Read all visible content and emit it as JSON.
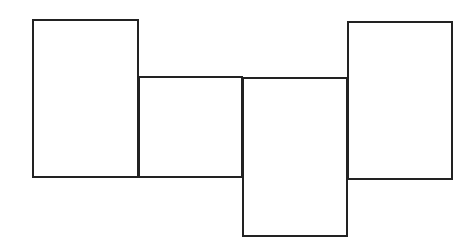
{
  "canvas": {
    "width": 474,
    "height": 246,
    "background": "#ffffff"
  },
  "style": {
    "stroke_color": "#222222",
    "stroke_width": 2
  },
  "shapes": [
    {
      "id": "rect-1",
      "label": "",
      "x": 32,
      "y": 19,
      "width": 107,
      "height": 159
    },
    {
      "id": "rect-2",
      "label": "",
      "x": 138,
      "y": 76,
      "width": 105,
      "height": 102
    },
    {
      "id": "rect-3",
      "label": "",
      "x": 242,
      "y": 77,
      "width": 106,
      "height": 160
    },
    {
      "id": "rect-4",
      "label": "",
      "x": 347,
      "y": 21,
      "width": 106,
      "height": 159
    }
  ]
}
